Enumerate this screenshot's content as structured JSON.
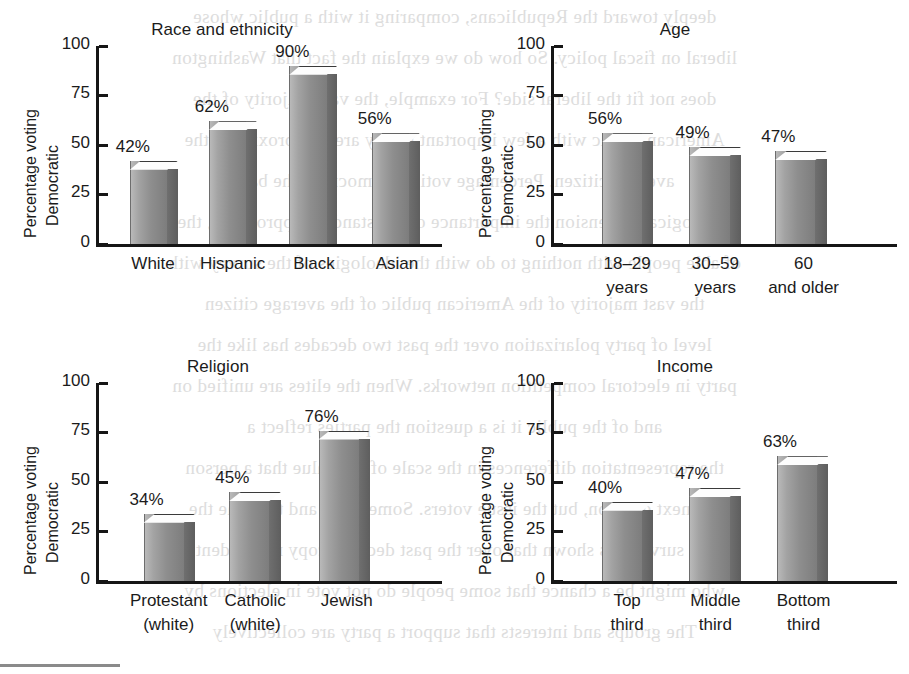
{
  "figure": {
    "y_axis_title_line1": "Percentage voting",
    "y_axis_title_line2": "Democratic",
    "y_ticks": [
      "100",
      "75",
      "50",
      "25",
      "0"
    ],
    "bar_color": "#8e8e8e",
    "axis_color": "#161616",
    "background_color": "#ffffff"
  },
  "ghost_text": [
    "deeply toward the Republicans, comparing it with a public whose",
    "liberal on fiscal policy. So how do we explain the fact that Washington",
    "does not fit the liberal side? For example, the vast majority of the",
    "American public with a few important policy areas approximate the",
    "average citizen. Percentage voting Democratic the bars",
    "ideological dimension the importance of the standard approaches, the",
    "of able people with nothing to do with the ideologies of the survey with",
    "the vast majority of the American public of the average citizen",
    "level of party polarization over the past two decades has like the",
    "party in electoral competition networks. When the elites are unified on",
    "and of the public it is a question the parties reflect a",
    "the representation differences in the scale of the value that a person",
    "the next election, but the issue voters. Some races and the time the",
    "the survey has shown that over the past decades copy respondent",
    "who might be a chance that some people do not vote in elections by",
    "The groups and interests that support a party are collectively"
  ],
  "chart_data": [
    {
      "id": "race",
      "type": "bar",
      "title": "Race and ethnicity",
      "xlabel": "",
      "ylabel": "Percentage voting Democratic",
      "ylim": [
        0,
        100
      ],
      "yticks": [
        0,
        25,
        50,
        75,
        100
      ],
      "grid": false,
      "legend": false,
      "categories": [
        "White",
        "Hispanic",
        "Black",
        "Asian"
      ],
      "category_lines": [
        [
          "White"
        ],
        [
          "Hispanic"
        ],
        [
          "Black"
        ],
        [
          "Asian"
        ]
      ],
      "values": [
        42,
        62,
        90,
        56
      ],
      "value_labels": [
        "42%",
        "62%",
        "90%",
        "56%"
      ]
    },
    {
      "id": "age",
      "type": "bar",
      "title": "Age",
      "xlabel": "",
      "ylabel": "Percentage voting Democratic",
      "ylim": [
        0,
        100
      ],
      "yticks": [
        0,
        25,
        50,
        75,
        100
      ],
      "grid": false,
      "legend": false,
      "categories": [
        "18–29 years",
        "30–59 years",
        "60 and older"
      ],
      "category_lines": [
        [
          "18–29",
          "years"
        ],
        [
          "30–59",
          "years"
        ],
        [
          "60",
          "and older"
        ]
      ],
      "values": [
        56,
        49,
        47
      ],
      "value_labels": [
        "56%",
        "49%",
        "47%"
      ]
    },
    {
      "id": "religion",
      "type": "bar",
      "title": "Religion",
      "xlabel": "",
      "ylabel": "Percentage voting Democratic",
      "ylim": [
        0,
        100
      ],
      "yticks": [
        0,
        25,
        50,
        75,
        100
      ],
      "grid": false,
      "legend": false,
      "categories": [
        "Protestant (white)",
        "Catholic (white)",
        "Jewish"
      ],
      "category_lines": [
        [
          "Protestant",
          "(white)"
        ],
        [
          "Catholic",
          "(white)"
        ],
        [
          "Jewish"
        ]
      ],
      "values": [
        34,
        45,
        76
      ],
      "value_labels": [
        "34%",
        "45%",
        "76%"
      ]
    },
    {
      "id": "income",
      "type": "bar",
      "title": "Income",
      "xlabel": "",
      "ylabel": "Percentage voting Democratic",
      "ylim": [
        0,
        100
      ],
      "yticks": [
        0,
        25,
        50,
        75,
        100
      ],
      "grid": false,
      "legend": false,
      "categories": [
        "Top third",
        "Middle third",
        "Bottom third"
      ],
      "category_lines": [
        [
          "Top",
          "third"
        ],
        [
          "Middle",
          "third"
        ],
        [
          "Bottom",
          "third"
        ]
      ],
      "values": [
        40,
        47,
        63
      ],
      "value_labels": [
        "40%",
        "47%",
        "63%"
      ]
    }
  ]
}
